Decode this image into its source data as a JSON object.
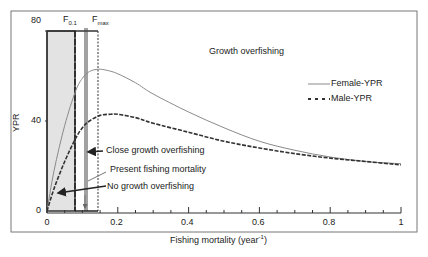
{
  "chart_data": {
    "type": "line",
    "title": "",
    "xlabel": "Fishing mortality (year⁻¹)",
    "ylabel": "YPR",
    "xlim": [
      0,
      1
    ],
    "ylim": [
      0,
      80
    ],
    "x_ticks": [
      "0",
      "0.2",
      "0.4",
      "0.6",
      "0.8",
      "1"
    ],
    "y_ticks": [
      "0",
      "40",
      "80"
    ],
    "grid": false,
    "legend_position": "upper right",
    "series": [
      {
        "name": "Female-YPR",
        "style": "solid",
        "x": [
          0,
          0.02,
          0.05,
          0.08,
          0.1,
          0.12,
          0.145,
          0.17,
          0.2,
          0.25,
          0.3,
          0.4,
          0.5,
          0.6,
          0.7,
          0.8,
          0.9,
          1.0
        ],
        "values": [
          0,
          18,
          38,
          53,
          59,
          62,
          63,
          62.5,
          61,
          57,
          52,
          44,
          37,
          31,
          27,
          24,
          22,
          21
        ]
      },
      {
        "name": "Male-YPR",
        "style": "dashed",
        "x": [
          0,
          0.02,
          0.05,
          0.08,
          0.1,
          0.12,
          0.15,
          0.18,
          0.2,
          0.25,
          0.3,
          0.4,
          0.5,
          0.6,
          0.7,
          0.8,
          0.9,
          1.0
        ],
        "values": [
          0,
          10,
          22,
          32,
          37,
          40,
          42.5,
          43,
          43,
          41.5,
          39,
          35,
          31,
          28,
          25.5,
          23.5,
          22,
          20.5
        ]
      }
    ],
    "reference_lines": [
      {
        "name": "F0.1",
        "x": 0.08,
        "style": "dashed"
      },
      {
        "name": "Present fishing mortality",
        "x": 0.11,
        "style": "solid-double"
      },
      {
        "name": "Fmax",
        "x": 0.145,
        "style": "dotted"
      }
    ],
    "shaded_region": {
      "x0": 0,
      "x1": 0.08,
      "label": "No growth overfishing"
    },
    "annotations": [
      "Growth overfishing",
      "Close growth overfishing",
      "Present fishing mortality",
      "No growth overfishing"
    ]
  },
  "labels": {
    "f01_main": "F",
    "f01_sub": "0.1",
    "fmax_main": "F",
    "fmax_sub": "max",
    "growth_overfishing": "Growth overfishing",
    "close_growth": "Close growth overfishing",
    "present": "Present fishing mortality",
    "no_growth": "No growth overfishing",
    "legend_female": "Female-YPR",
    "legend_male": "Male-YPR",
    "ylabel": "YPR",
    "xlabel_main": "Fishing mortality (year",
    "xlabel_sup": "-1",
    "xlabel_end": ")"
  },
  "colors": {
    "female": "#8a8a8a",
    "male": "#333333",
    "shade": "#e0e0e0",
    "frame": "#555555"
  }
}
